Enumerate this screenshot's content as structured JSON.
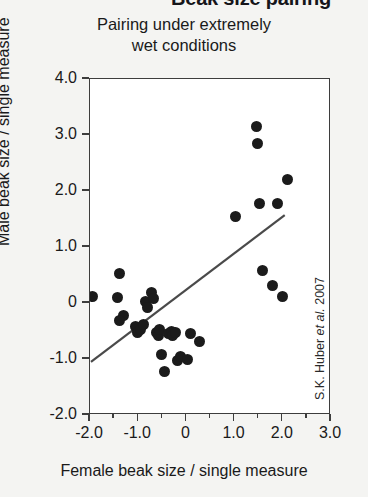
{
  "header": {
    "text": "Beak size pairing"
  },
  "subtitle": {
    "line1": "Pairing under extremely",
    "line2": "wet conditions"
  },
  "credit": {
    "prefix": "S.K. Huber ",
    "italic": "et al.",
    "suffix": " 2007"
  },
  "colors": {
    "background": "#f4f4f2",
    "plot_background": "#ffffff",
    "axis": "#3d3d3d",
    "marker": "#1b1b1b",
    "fit_line": "#4a4a4a",
    "text": "#1a1a1a"
  },
  "chart_data": {
    "type": "scatter",
    "title": "Beak size pairing",
    "subtitle": "Pairing under extremely wet conditions",
    "xlabel": "Female beak size / single measure",
    "ylabel": "Male beak size / single measure",
    "xlim": [
      -2.0,
      3.0
    ],
    "ylim": [
      -2.0,
      4.0
    ],
    "xticks": [
      -2.0,
      -1.0,
      0,
      1.0,
      2.0,
      3.0
    ],
    "xtick_labels": [
      "-2.0",
      "-1.0",
      "0",
      "1.0",
      "2.0",
      "3.0"
    ],
    "xticks_minor": [
      -1.5,
      -0.5,
      0.5,
      1.5,
      2.5
    ],
    "yticks": [
      4.0,
      3.0,
      2.0,
      1.0,
      0,
      -1.0,
      -2.0
    ],
    "ytick_labels": [
      "4.0",
      "3.0",
      "2.0",
      "1.0",
      "0",
      "-1.0",
      "-2.0"
    ],
    "grid": false,
    "legend": null,
    "marker_shape": "circle",
    "marker_color": "#1b1b1b",
    "points": [
      [
        -1.95,
        0.12
      ],
      [
        -1.38,
        0.52
      ],
      [
        -1.42,
        0.1
      ],
      [
        -1.3,
        -0.22
      ],
      [
        -1.38,
        -0.32
      ],
      [
        -1.05,
        -0.42
      ],
      [
        -1.02,
        -0.52
      ],
      [
        -0.95,
        -0.48
      ],
      [
        -0.88,
        -0.38
      ],
      [
        -0.85,
        0.02
      ],
      [
        -0.8,
        -0.08
      ],
      [
        -0.72,
        0.18
      ],
      [
        -0.68,
        0.08
      ],
      [
        -0.62,
        -0.52
      ],
      [
        -0.58,
        -0.58
      ],
      [
        -0.55,
        -0.48
      ],
      [
        -0.52,
        -0.92
      ],
      [
        -0.45,
        -1.22
      ],
      [
        -0.38,
        -0.55
      ],
      [
        -0.3,
        -0.5
      ],
      [
        -0.28,
        -0.58
      ],
      [
        -0.22,
        -0.52
      ],
      [
        -0.18,
        -1.02
      ],
      [
        -0.12,
        -0.95
      ],
      [
        0.02,
        -1.0
      ],
      [
        0.08,
        -0.55
      ],
      [
        0.28,
        -0.68
      ],
      [
        1.02,
        1.55
      ],
      [
        1.45,
        3.15
      ],
      [
        1.48,
        2.85
      ],
      [
        1.52,
        1.78
      ],
      [
        1.58,
        0.58
      ],
      [
        1.78,
        0.32
      ],
      [
        1.9,
        1.78
      ],
      [
        2.0,
        0.12
      ],
      [
        2.1,
        2.2
      ]
    ],
    "fit_line": {
      "x0": -1.98,
      "y0": -1.05,
      "x1": 2.04,
      "y1": 1.57
    }
  }
}
